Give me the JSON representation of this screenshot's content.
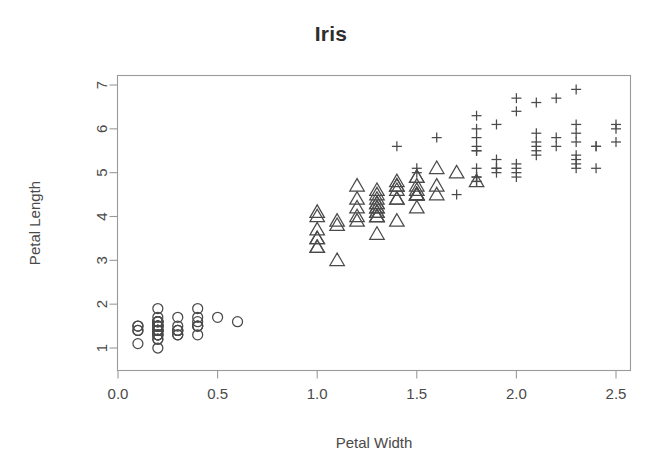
{
  "chart_data": {
    "type": "scatter",
    "title": "Iris",
    "xlabel": "Petal Width",
    "ylabel": "Petal Length",
    "xlim": [
      0.0,
      2.5
    ],
    "ylim": [
      1.0,
      7.0
    ],
    "xticks": [
      "0.0",
      "0.5",
      "1.0",
      "1.5",
      "2.0",
      "2.5"
    ],
    "xtick_values": [
      0.0,
      0.5,
      1.0,
      1.5,
      2.0,
      2.5
    ],
    "yticks": [
      "1",
      "2",
      "3",
      "4",
      "5",
      "6",
      "7"
    ],
    "ytick_values": [
      1,
      2,
      3,
      4,
      5,
      6,
      7
    ],
    "grid": false,
    "legend": "none",
    "marker_color": "#4a4a4a",
    "frame_color": "#9a9a9a",
    "background": "#ffffff",
    "series": [
      {
        "name": "setosa",
        "marker": "circle",
        "x": [
          0.2,
          0.2,
          0.2,
          0.2,
          0.2,
          0.4,
          0.3,
          0.2,
          0.2,
          0.1,
          0.2,
          0.2,
          0.1,
          0.1,
          0.2,
          0.4,
          0.4,
          0.3,
          0.3,
          0.3,
          0.2,
          0.4,
          0.2,
          0.5,
          0.2,
          0.2,
          0.4,
          0.2,
          0.2,
          0.2,
          0.2,
          0.4,
          0.1,
          0.2,
          0.2,
          0.2,
          0.2,
          0.1,
          0.2,
          0.2,
          0.3,
          0.3,
          0.2,
          0.6,
          0.4,
          0.3,
          0.2,
          0.2,
          0.2,
          0.2
        ],
        "y": [
          1.4,
          1.4,
          1.3,
          1.5,
          1.4,
          1.7,
          1.4,
          1.5,
          1.4,
          1.5,
          1.5,
          1.6,
          1.4,
          1.1,
          1.2,
          1.5,
          1.3,
          1.4,
          1.7,
          1.5,
          1.7,
          1.5,
          1.0,
          1.7,
          1.9,
          1.6,
          1.6,
          1.5,
          1.4,
          1.6,
          1.6,
          1.5,
          1.5,
          1.4,
          1.5,
          1.2,
          1.3,
          1.4,
          1.3,
          1.5,
          1.3,
          1.3,
          1.3,
          1.6,
          1.9,
          1.4,
          1.6,
          1.4,
          1.5,
          1.4
        ]
      },
      {
        "name": "versicolor",
        "marker": "triangle",
        "x": [
          1.4,
          1.5,
          1.5,
          1.3,
          1.5,
          1.3,
          1.6,
          1.0,
          1.3,
          1.4,
          1.0,
          1.5,
          1.0,
          1.4,
          1.3,
          1.4,
          1.5,
          1.0,
          1.5,
          1.1,
          1.8,
          1.3,
          1.5,
          1.2,
          1.3,
          1.4,
          1.4,
          1.7,
          1.5,
          1.0,
          1.1,
          1.0,
          1.2,
          1.6,
          1.5,
          1.6,
          1.5,
          1.3,
          1.3,
          1.3,
          1.2,
          1.4,
          1.2,
          1.0,
          1.3,
          1.2,
          1.3,
          1.3,
          1.1,
          1.3
        ],
        "y": [
          4.7,
          4.5,
          4.9,
          4.0,
          4.6,
          4.5,
          4.7,
          3.3,
          4.6,
          3.9,
          3.5,
          4.2,
          4.0,
          4.7,
          3.6,
          4.4,
          4.5,
          4.1,
          4.5,
          3.9,
          4.8,
          4.0,
          4.9,
          4.7,
          4.3,
          4.4,
          4.8,
          5.0,
          4.5,
          3.5,
          3.8,
          3.7,
          3.9,
          5.1,
          4.5,
          4.5,
          4.7,
          4.4,
          4.1,
          4.0,
          4.4,
          4.6,
          4.0,
          3.3,
          4.2,
          4.2,
          4.2,
          4.3,
          3.0,
          4.1
        ]
      },
      {
        "name": "virginica",
        "marker": "plus",
        "x": [
          2.5,
          1.9,
          2.1,
          1.8,
          2.2,
          2.1,
          1.7,
          1.8,
          1.8,
          2.5,
          2.0,
          1.9,
          2.1,
          2.0,
          2.4,
          2.3,
          1.8,
          2.2,
          2.3,
          1.5,
          2.3,
          2.0,
          2.0,
          1.8,
          2.1,
          1.8,
          1.8,
          1.8,
          2.1,
          1.6,
          1.9,
          2.0,
          2.2,
          1.5,
          1.4,
          2.3,
          2.4,
          1.8,
          1.8,
          2.1,
          2.4,
          2.3,
          1.9,
          2.3,
          2.5,
          2.3,
          1.9,
          2.0,
          2.3,
          1.8
        ],
        "y": [
          6.0,
          5.1,
          5.9,
          5.6,
          5.8,
          6.6,
          4.5,
          6.3,
          5.8,
          6.1,
          5.1,
          5.3,
          5.5,
          5.0,
          5.1,
          5.3,
          5.5,
          6.7,
          6.9,
          5.0,
          5.7,
          4.9,
          6.7,
          4.9,
          5.7,
          6.0,
          4.8,
          4.9,
          5.6,
          5.8,
          6.1,
          6.4,
          5.6,
          5.1,
          5.6,
          6.1,
          5.6,
          5.5,
          4.8,
          5.4,
          5.6,
          5.1,
          5.1,
          5.9,
          5.7,
          5.2,
          5.0,
          5.2,
          5.4,
          5.1
        ]
      }
    ]
  }
}
